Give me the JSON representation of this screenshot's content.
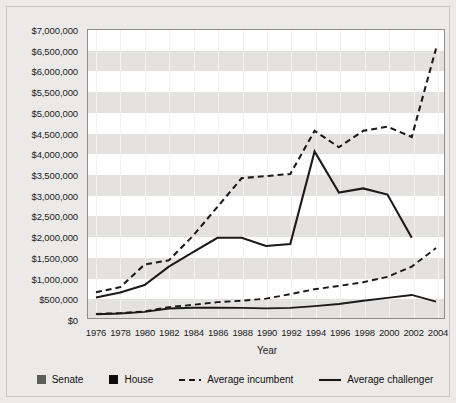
{
  "chart_data": {
    "type": "line",
    "title": "",
    "xlabel": "Year",
    "ylabel": "",
    "grid": "horizontal-bands",
    "legend_position": "bottom",
    "x": [
      1976,
      1978,
      1980,
      1982,
      1984,
      1986,
      1988,
      1990,
      1992,
      1994,
      1996,
      1998,
      2000,
      2002,
      2004
    ],
    "xticklabels": [
      "1976",
      "1978",
      "1980",
      "1982",
      "1984",
      "1986",
      "1988",
      "1990",
      "1992",
      "1994",
      "1996",
      "1998",
      "2000",
      "2002",
      "2004"
    ],
    "ylim": [
      0,
      7000000
    ],
    "yticks": [
      0,
      500000,
      1000000,
      1500000,
      2000000,
      2500000,
      3000000,
      3500000,
      4000000,
      4500000,
      5000000,
      5500000,
      6000000,
      6500000,
      7000000
    ],
    "yticklabels": [
      "$0",
      "$500,000",
      "$1,000,000",
      "$1,500,000",
      "$2,000,000",
      "$2,500,000",
      "$3,000,000",
      "$3,500,000",
      "$4,000,000",
      "$4,500,000",
      "$5,000,000",
      "$5,500,000",
      "$6,000,000",
      "$6,500,000",
      "$7,000,000"
    ],
    "series": [
      {
        "name": "Senate Average incumbent",
        "chamber": "Senate",
        "role": "Average incumbent",
        "style": "dashed",
        "color": "#1a1a1a",
        "values": [
          625000,
          750000,
          1300000,
          1400000,
          2000000,
          2700000,
          3400000,
          3450000,
          3500000,
          4550000,
          4150000,
          4550000,
          4650000,
          4400000,
          6550000
        ]
      },
      {
        "name": "Senate Average challenger",
        "chamber": "Senate",
        "role": "Average challenger",
        "style": "solid",
        "color": "#1a1a1a",
        "values": [
          500000,
          620000,
          800000,
          1250000,
          1600000,
          1950000,
          1950000,
          1750000,
          1800000,
          4050000,
          3050000,
          3150000,
          3000000,
          1950000,
          null
        ]
      },
      {
        "name": "House Average incumbent",
        "chamber": "House",
        "role": "Average incumbent",
        "style": "dashed",
        "color": "#1a1a1a",
        "values": [
          100000,
          120000,
          160000,
          265000,
          320000,
          385000,
          420000,
          470000,
          580000,
          700000,
          780000,
          870000,
          1000000,
          1250000,
          1700000
        ]
      },
      {
        "name": "House Average challenger",
        "chamber": "House",
        "role": "Average challenger",
        "style": "solid",
        "color": "#1a1a1a",
        "values": [
          90000,
          110000,
          150000,
          230000,
          250000,
          250000,
          245000,
          235000,
          245000,
          290000,
          340000,
          420000,
          490000,
          560000,
          400000
        ]
      }
    ]
  },
  "axes": {
    "x_title": "Year"
  },
  "legend": {
    "items": [
      {
        "label": "Senate",
        "marker": "square-swatch",
        "color": "#5d5d5d"
      },
      {
        "label": "House",
        "marker": "square-swatch",
        "color": "#0d0d0d"
      },
      {
        "label": "Average incumbent",
        "marker": "dashed-line-swatch",
        "color": "#1a1a1a"
      },
      {
        "label": "Average challenger",
        "marker": "solid-line-swatch",
        "color": "#1a1a1a"
      }
    ]
  },
  "colors": {
    "figure_background": "#eceae8",
    "plot_background": "#ffffff",
    "band": "#e3e2e1",
    "axis": "#8d8d8d",
    "text": "#1c1c1c"
  }
}
